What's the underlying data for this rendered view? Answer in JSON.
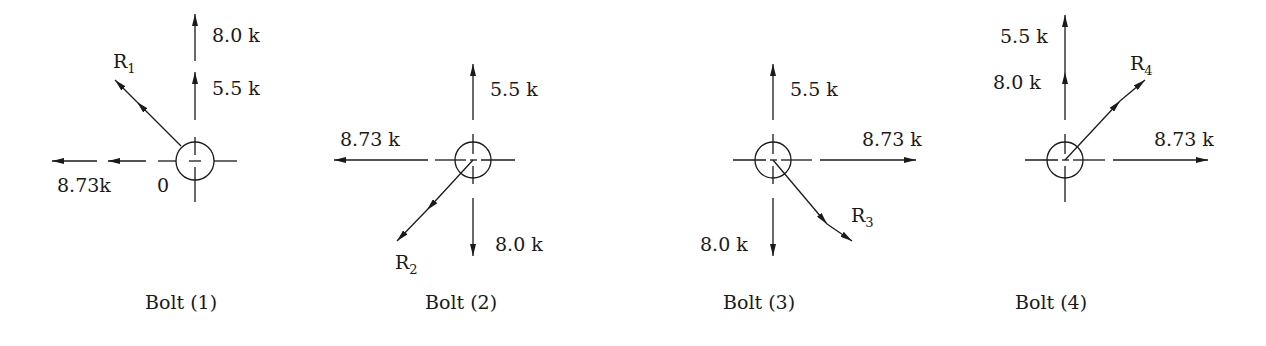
{
  "diagram": {
    "type": "bolt force free-body diagrams",
    "stroke_color": "#1a1a1a",
    "bolts": [
      {
        "caption": "Bolt (1)",
        "resultant": {
          "label": "R",
          "subscript": "1",
          "direction": "up-left"
        },
        "forces": [
          {
            "label": "8.0 k",
            "direction": "up"
          },
          {
            "label": "5.5 k",
            "direction": "up"
          },
          {
            "label": "8.73k",
            "direction": "left"
          },
          {
            "label": "0",
            "direction": "left"
          }
        ]
      },
      {
        "caption": "Bolt (2)",
        "resultant": {
          "label": "R",
          "subscript": "2",
          "direction": "down-left"
        },
        "forces": [
          {
            "label": "5.5 k",
            "direction": "up"
          },
          {
            "label": "8.73 k",
            "direction": "left"
          },
          {
            "label": "8.0 k",
            "direction": "down"
          }
        ]
      },
      {
        "caption": "Bolt (3)",
        "resultant": {
          "label": "R",
          "subscript": "3",
          "direction": "down-right"
        },
        "forces": [
          {
            "label": "5.5 k",
            "direction": "up"
          },
          {
            "label": "8.73 k",
            "direction": "right"
          },
          {
            "label": "8.0 k",
            "direction": "down"
          }
        ]
      },
      {
        "caption": "Bolt (4)",
        "resultant": {
          "label": "R",
          "subscript": "4",
          "direction": "up-right"
        },
        "forces": [
          {
            "label": "5.5 k",
            "direction": "up"
          },
          {
            "label": "8.0 k",
            "direction": "up"
          },
          {
            "label": "8.73 k",
            "direction": "right"
          }
        ]
      }
    ]
  }
}
